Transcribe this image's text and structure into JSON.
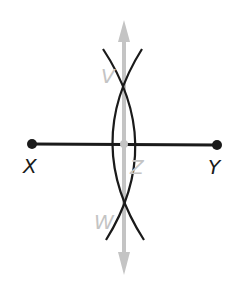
{
  "diagram": {
    "points": {
      "X": {
        "label": "X"
      },
      "Y": {
        "label": "Y"
      },
      "V": {
        "label": "V"
      },
      "W": {
        "label": "W"
      },
      "Z": {
        "label": "Z"
      }
    },
    "colors": {
      "segment": "#1a1a1a",
      "arcs": "#1a1a1a",
      "bisector": "#c4c4c4",
      "labels_primary": "#1a1a1a",
      "labels_construction": "#c4c4c4"
    }
  }
}
